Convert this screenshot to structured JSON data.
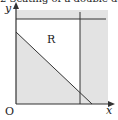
{
  "caption": "2   Seating of a double deck",
  "diagram": {
    "y_axis_label": "y",
    "x_axis_label": "x",
    "origin_label": "O",
    "region_label": "R",
    "colors": {
      "shade": "#e3e3e3",
      "line": "#333333",
      "background": "#ffffff"
    },
    "lines": [
      {
        "name": "horizontal-boundary",
        "from": [
          16,
          19
        ],
        "to": [
          106,
          19
        ]
      },
      {
        "name": "vertical-boundary",
        "from": [
          80,
          12
        ],
        "to": [
          80,
          104
        ]
      },
      {
        "name": "diagonal-boundary",
        "from": [
          16,
          32
        ],
        "to": [
          92,
          104
        ]
      }
    ]
  }
}
